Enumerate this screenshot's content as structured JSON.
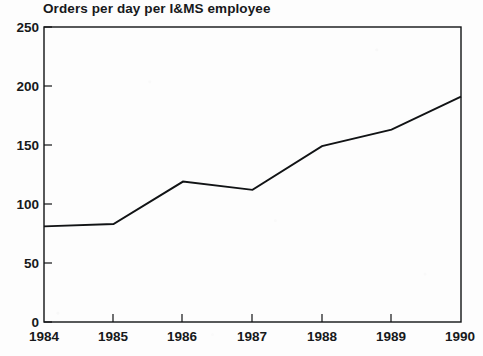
{
  "chart_data": {
    "type": "line",
    "title": "Orders per day per I&MS employee",
    "xlabel": "",
    "ylabel": "",
    "categories": [
      "1984",
      "1985",
      "1986",
      "1987",
      "1988",
      "1989",
      "1990"
    ],
    "x": [
      1984,
      1985,
      1986,
      1987,
      1988,
      1989,
      1990
    ],
    "values": [
      81,
      83,
      119,
      112,
      149,
      163,
      191
    ],
    "series": [
      {
        "name": "Orders per day per I&MS employee",
        "values": [
          81,
          83,
          119,
          112,
          149,
          163,
          191
        ]
      }
    ],
    "ylim": [
      0,
      250
    ],
    "ytick_labels": [
      "0",
      "50",
      "100",
      "150",
      "200",
      "250"
    ],
    "ytick_values": [
      0,
      50,
      100,
      150,
      200,
      250
    ],
    "xtick_labels": [
      "1984",
      "1985",
      "1986",
      "1987",
      "1988",
      "1989",
      "1990"
    ],
    "grid": false,
    "legend": "none",
    "line_color": "#111315",
    "axis_color": "#111315",
    "background_color": "#fdfdfd",
    "frame": "box"
  }
}
